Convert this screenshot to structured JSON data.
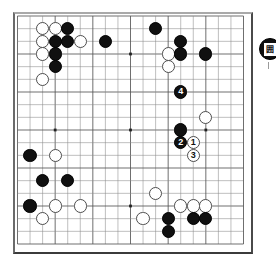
{
  "app": {
    "title": "Go board diagram",
    "board_size": 19,
    "description": "Go game position diagram with numbered move sequence"
  },
  "board": {
    "size": 19,
    "line_color": "#8a8a8a",
    "major_line_color": "#555555",
    "star_point_color": "#222222",
    "background": "#ffffff",
    "star_points": [
      {
        "col": 3,
        "row": 3
      },
      {
        "col": 9,
        "row": 3
      },
      {
        "col": 15,
        "row": 3
      },
      {
        "col": 3,
        "row": 9
      },
      {
        "col": 9,
        "row": 9
      },
      {
        "col": 15,
        "row": 9
      },
      {
        "col": 3,
        "row": 15
      },
      {
        "col": 9,
        "row": 15
      },
      {
        "col": 15,
        "row": 15
      }
    ]
  },
  "colors": {
    "black_stone": "#101010",
    "white_stone": "#ffffff",
    "white_stone_edge": "#4d4d4d",
    "black_label": "#ffffff",
    "white_label": "#111111",
    "board_border": "#4a4a4a"
  },
  "stones": [
    {
      "col": 2,
      "row": 1,
      "color": "white",
      "label": ""
    },
    {
      "col": 3,
      "row": 1,
      "color": "white",
      "label": ""
    },
    {
      "col": 4,
      "row": 1,
      "color": "black",
      "label": ""
    },
    {
      "col": 2,
      "row": 2,
      "color": "white",
      "label": ""
    },
    {
      "col": 3,
      "row": 2,
      "color": "black",
      "label": ""
    },
    {
      "col": 4,
      "row": 2,
      "color": "black",
      "label": ""
    },
    {
      "col": 5,
      "row": 2,
      "color": "white",
      "label": ""
    },
    {
      "col": 2,
      "row": 3,
      "color": "white",
      "label": ""
    },
    {
      "col": 3,
      "row": 3,
      "color": "black",
      "label": ""
    },
    {
      "col": 3,
      "row": 4,
      "color": "black",
      "label": ""
    },
    {
      "col": 2,
      "row": 5,
      "color": "white",
      "label": ""
    },
    {
      "col": 7,
      "row": 2,
      "color": "black",
      "label": ""
    },
    {
      "col": 11,
      "row": 1,
      "color": "black",
      "label": ""
    },
    {
      "col": 13,
      "row": 2,
      "color": "black",
      "label": ""
    },
    {
      "col": 12,
      "row": 3,
      "color": "white",
      "label": ""
    },
    {
      "col": 13,
      "row": 3,
      "color": "black",
      "label": ""
    },
    {
      "col": 15,
      "row": 3,
      "color": "black",
      "label": ""
    },
    {
      "col": 12,
      "row": 4,
      "color": "white",
      "label": ""
    },
    {
      "col": 13,
      "row": 6,
      "color": "black",
      "label": "4"
    },
    {
      "col": 15,
      "row": 8,
      "color": "white",
      "label": ""
    },
    {
      "col": 13,
      "row": 9,
      "color": "black",
      "label": ""
    },
    {
      "col": 13,
      "row": 10,
      "color": "black",
      "label": "2"
    },
    {
      "col": 14,
      "row": 10,
      "color": "white",
      "label": "1"
    },
    {
      "col": 14,
      "row": 11,
      "color": "white",
      "label": "3"
    },
    {
      "col": 1,
      "row": 11,
      "color": "black",
      "label": ""
    },
    {
      "col": 3,
      "row": 11,
      "color": "white",
      "label": ""
    },
    {
      "col": 2,
      "row": 13,
      "color": "black",
      "label": ""
    },
    {
      "col": 4,
      "row": 13,
      "color": "black",
      "label": ""
    },
    {
      "col": 1,
      "row": 15,
      "color": "black",
      "label": ""
    },
    {
      "col": 3,
      "row": 15,
      "color": "white",
      "label": ""
    },
    {
      "col": 5,
      "row": 15,
      "color": "white",
      "label": ""
    },
    {
      "col": 2,
      "row": 16,
      "color": "white",
      "label": ""
    },
    {
      "col": 11,
      "row": 14,
      "color": "white",
      "label": ""
    },
    {
      "col": 10,
      "row": 16,
      "color": "white",
      "label": ""
    },
    {
      "col": 13,
      "row": 15,
      "color": "white",
      "label": ""
    },
    {
      "col": 14,
      "row": 15,
      "color": "white",
      "label": ""
    },
    {
      "col": 15,
      "row": 15,
      "color": "white",
      "label": ""
    },
    {
      "col": 12,
      "row": 16,
      "color": "black",
      "label": ""
    },
    {
      "col": 14,
      "row": 16,
      "color": "black",
      "label": ""
    },
    {
      "col": 15,
      "row": 16,
      "color": "black",
      "label": ""
    },
    {
      "col": 12,
      "row": 17,
      "color": "black",
      "label": ""
    }
  ],
  "move_sequence": [
    {
      "number": "1",
      "color": "white"
    },
    {
      "number": "2",
      "color": "black"
    },
    {
      "number": "3",
      "color": "white"
    },
    {
      "number": "4",
      "color": "black"
    }
  ],
  "side_marker": {
    "color": "black",
    "glyph": "囲",
    "visible": true
  }
}
